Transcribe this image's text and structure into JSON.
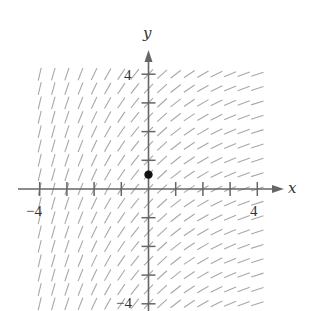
{
  "figure": {
    "type": "slope-field",
    "axes": {
      "x_label": "x",
      "y_label": "y",
      "x_range": [
        -4,
        4
      ],
      "y_range": [
        -4,
        4
      ],
      "tick_step": 1,
      "labeled_ticks": {
        "x_min_label": "−4",
        "x_max_label": "4",
        "y_max_label": "4",
        "y_min_label": "−4"
      }
    },
    "slope_field": {
      "description": "Slopes depend on x only: steep on the left, shallow on the right",
      "grid_step": 0.5,
      "x_from": -4,
      "x_to": 4,
      "y_from": -4,
      "y_to": 4,
      "slope_at_left_edge": 4.0,
      "slope_at_origin": 1.0,
      "slope_at_right_edge": 0.3
    },
    "marked_point": {
      "x": 0,
      "y": 0.5,
      "label": ""
    },
    "colors": {
      "axis": "#666666",
      "segment": "#a8a8a8",
      "point": "#111111",
      "text": "#333333",
      "background": "#ffffff"
    }
  }
}
